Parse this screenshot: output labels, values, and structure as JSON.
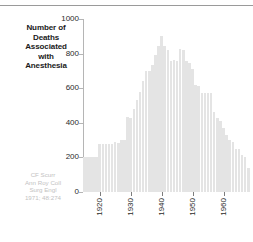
{
  "figure": {
    "title_lines": [
      "Number of",
      "Deaths",
      "Associated",
      "with",
      "Anesthesia"
    ],
    "citation_lines": [
      "CF Scurr",
      "Ann Roy Coll",
      "Surg Engl",
      "1971; 48:274"
    ],
    "bar_color": "#e4e4e4",
    "axis_color": "#b5b5b5",
    "text_color": "#2b2b2b",
    "citation_color": "#c2c2c2"
  },
  "chart_data": {
    "type": "bar",
    "title": "Number of Deaths Associated with Anesthesia",
    "xlabel": "",
    "ylabel": "",
    "ylim": [
      0,
      1000
    ],
    "yticks": [
      0,
      200,
      400,
      600,
      800,
      1000
    ],
    "ytick_labels": [
      "0",
      "200",
      "400",
      "600",
      "800",
      "1000"
    ],
    "xlim": [
      1914,
      1969
    ],
    "xticks": [
      1920,
      1930,
      1940,
      1950,
      1960
    ],
    "xtick_labels": [
      "1920",
      "1930",
      "1940",
      "1950",
      "1960"
    ],
    "grid": false,
    "legend": null,
    "annotations": [
      "CF Scurr",
      "Ann Roy Coll",
      "Surg Engl",
      "1971; 48:274"
    ],
    "categories": [
      "1915",
      "1916",
      "1917",
      "1918",
      "1919",
      "1920",
      "1921",
      "1922",
      "1923",
      "1924",
      "1925",
      "1926",
      "1927",
      "1928",
      "1929",
      "1930",
      "1931",
      "1932",
      "1933",
      "1934",
      "1935",
      "1936",
      "1937",
      "1938",
      "1939",
      "1940",
      "1941",
      "1942",
      "1943",
      "1944",
      "1945",
      "1946",
      "1947",
      "1948",
      "1949",
      "1950",
      "1951",
      "1952",
      "1953",
      "1954",
      "1955",
      "1956",
      "1957",
      "1958",
      "1959",
      "1960",
      "1961",
      "1962",
      "1963",
      "1964",
      "1965",
      "1966",
      "1967",
      "1968"
    ],
    "values": [
      200,
      200,
      200,
      200,
      200,
      280,
      280,
      280,
      280,
      280,
      290,
      285,
      300,
      300,
      435,
      430,
      480,
      530,
      580,
      640,
      700,
      700,
      735,
      790,
      845,
      900,
      845,
      820,
      760,
      765,
      760,
      825,
      820,
      760,
      745,
      710,
      620,
      615,
      570,
      570,
      570,
      570,
      465,
      430,
      410,
      370,
      330,
      300,
      290,
      250,
      250,
      215,
      205,
      140
    ]
  }
}
